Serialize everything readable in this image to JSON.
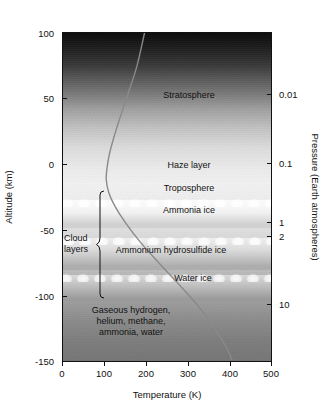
{
  "chart_data": {
    "type": "line",
    "title": "",
    "xlabel": "Temperature (K)",
    "ylabel": "Altitude (km)",
    "y2label": "Pressure (Earth atmospheres)",
    "xlim": [
      0,
      500
    ],
    "ylim": [
      -150,
      100
    ],
    "xticks": [
      "0",
      "100",
      "200",
      "300",
      "400",
      "500"
    ],
    "yticks": [
      "100",
      "50",
      "0",
      "-50",
      "-100",
      "-150"
    ],
    "y2ticks": [
      "0.01",
      "0.1",
      "1",
      "2",
      "10"
    ],
    "grid": false,
    "legend": null,
    "series": [
      {
        "name": "Temperature profile",
        "color": "#8a8a8a",
        "points": [
          {
            "t": 196,
            "alt": 100
          },
          {
            "t": 178,
            "alt": 75
          },
          {
            "t": 158,
            "alt": 55
          },
          {
            "t": 140,
            "alt": 38
          },
          {
            "t": 124,
            "alt": 22
          },
          {
            "t": 112,
            "alt": 8
          },
          {
            "t": 106,
            "alt": -3
          },
          {
            "t": 104,
            "alt": -12
          },
          {
            "t": 110,
            "alt": -22
          },
          {
            "t": 124,
            "alt": -32
          },
          {
            "t": 150,
            "alt": -45
          },
          {
            "t": 186,
            "alt": -60
          },
          {
            "t": 228,
            "alt": -75
          },
          {
            "t": 272,
            "alt": -90
          },
          {
            "t": 312,
            "alt": -104
          },
          {
            "t": 352,
            "alt": -120
          },
          {
            "t": 392,
            "alt": -140
          },
          {
            "t": 406,
            "alt": -150
          }
        ]
      }
    ],
    "annotations": [
      {
        "name": "stratosphere",
        "text": "Stratosphere",
        "t": 300,
        "alt": 52
      },
      {
        "name": "haze-layer",
        "text": "Haze layer",
        "t": 300,
        "alt": -1
      },
      {
        "name": "troposphere",
        "text": "Troposphere",
        "t": 300,
        "alt": -18
      },
      {
        "name": "ammonia-ice",
        "text": "Ammonia ice",
        "t": 300,
        "alt": -35
      },
      {
        "name": "ammonium-hydrosulfide-ice",
        "text": "Ammonium hydrosulfide ice",
        "t": 260,
        "alt": -62
      },
      {
        "name": "water-ice",
        "text": "Water ice",
        "t": 305,
        "alt": -90
      },
      {
        "name": "deep-atmosphere-composition",
        "text": "Gaseous hydrogen, helium, methane, ammonia, water",
        "t": 165,
        "alt": -113
      },
      {
        "name": "cloud-layers-bracket",
        "text": "Cloud layers",
        "t": 20,
        "alt": -50
      }
    ]
  },
  "labels": {
    "stratosphere": "Stratosphere",
    "haze_layer": "Haze layer",
    "troposphere": "Troposphere",
    "ammonia_ice": "Ammonia ice",
    "ammonium_hydrosulfide_ice": "Ammonium hydrosulfide ice",
    "water_ice": "Water ice",
    "deep_line1": "Gaseous hydrogen,",
    "deep_line2": "helium, methane,",
    "deep_line3": "ammonia, water",
    "cloud_line1": "Cloud",
    "cloud_line2": "layers"
  },
  "axes": {
    "x_title": "Temperature (K)",
    "y_left_title": "Altitude (km)",
    "y_right_title": "Pressure (Earth atmospheres)",
    "x_ticks": [
      "0",
      "100",
      "200",
      "300",
      "400",
      "500"
    ],
    "y_left_ticks": [
      "100",
      "50",
      "0",
      "-50",
      "-100",
      "-150"
    ],
    "y_right_ticks": [
      "0.01",
      "0.1",
      "1",
      "2",
      "10"
    ]
  },
  "colors": {
    "curve": "#8a8a8a",
    "axis": "#111111",
    "text": "#1a1a1a",
    "background": "#ffffff"
  }
}
